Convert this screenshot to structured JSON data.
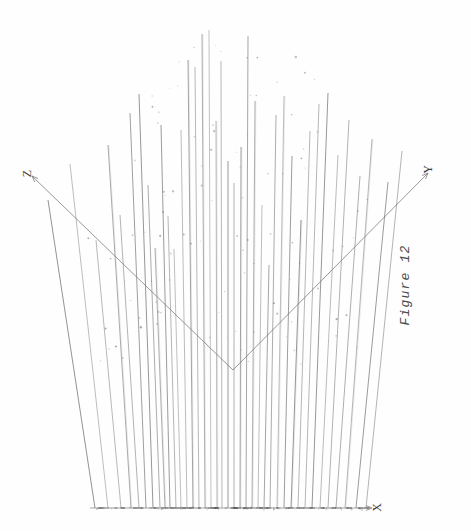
{
  "figure": {
    "caption": "Figure 12",
    "axes": {
      "x_label": "X",
      "y_label": "Y",
      "z_label": "Z"
    },
    "background_color": "#fefefe",
    "ink_color": "#6b6b6b",
    "axis_color": "#777777"
  },
  "chart_data": {
    "type": "scatter",
    "title": "Figure 12",
    "subtitle": "",
    "xlabel": "X",
    "ylabel": "Y",
    "zlabel": "Z",
    "projection": "3d-perspective-stem",
    "grid": false,
    "legend": null,
    "annotations": [],
    "origin_vertex": [
      233,
      370
    ],
    "axis_endpoints": {
      "z_axis": [
        [
          32,
          176
        ],
        [
          233,
          370
        ]
      ],
      "y_axis": [
        [
          233,
          370
        ],
        [
          428,
          173
        ]
      ],
      "x_axis": [
        [
          90,
          508
        ],
        [
          370,
          508
        ]
      ]
    },
    "baseline_y": 508,
    "stems": [
      {
        "x_base": 95,
        "x_top": 48,
        "y_top": 200,
        "height": 308
      },
      {
        "x_base": 108,
        "x_top": 70,
        "y_top": 164,
        "height": 344
      },
      {
        "x_base": 121,
        "x_top": 96,
        "y_top": 240,
        "height": 268
      },
      {
        "x_base": 131,
        "x_top": 108,
        "y_top": 145,
        "height": 363
      },
      {
        "x_base": 139,
        "x_top": 120,
        "y_top": 215,
        "height": 293
      },
      {
        "x_base": 146,
        "x_top": 130,
        "y_top": 113,
        "height": 395
      },
      {
        "x_base": 153,
        "x_top": 139,
        "y_top": 94,
        "height": 414
      },
      {
        "x_base": 160,
        "x_top": 148,
        "y_top": 185,
        "height": 323
      },
      {
        "x_base": 165,
        "x_top": 155,
        "y_top": 248,
        "height": 260
      },
      {
        "x_base": 170,
        "x_top": 161,
        "y_top": 125,
        "height": 383
      },
      {
        "x_base": 176,
        "x_top": 168,
        "y_top": 216,
        "height": 292
      },
      {
        "x_base": 181,
        "x_top": 174,
        "y_top": 249,
        "height": 259
      },
      {
        "x_base": 187,
        "x_top": 181,
        "y_top": 130,
        "height": 378
      },
      {
        "x_base": 193,
        "x_top": 188,
        "y_top": 60,
        "height": 448
      },
      {
        "x_base": 199,
        "x_top": 195,
        "y_top": 67,
        "height": 441
      },
      {
        "x_base": 205,
        "x_top": 202,
        "y_top": 34,
        "height": 474
      },
      {
        "x_base": 211,
        "x_top": 209,
        "y_top": 30,
        "height": 478
      },
      {
        "x_base": 217,
        "x_top": 216,
        "y_top": 121,
        "height": 387
      },
      {
        "x_base": 222,
        "x_top": 221,
        "y_top": 61,
        "height": 447
      },
      {
        "x_base": 228,
        "x_top": 228,
        "y_top": 161,
        "height": 347
      },
      {
        "x_base": 234,
        "x_top": 234,
        "y_top": 183,
        "height": 325
      },
      {
        "x_base": 240,
        "x_top": 241,
        "y_top": 147,
        "height": 361
      },
      {
        "x_base": 246,
        "x_top": 248,
        "y_top": 36,
        "height": 472
      },
      {
        "x_base": 252,
        "x_top": 255,
        "y_top": 101,
        "height": 407
      },
      {
        "x_base": 258,
        "x_top": 262,
        "y_top": 205,
        "height": 303
      },
      {
        "x_base": 264,
        "x_top": 269,
        "y_top": 265,
        "height": 243
      },
      {
        "x_base": 270,
        "x_top": 276,
        "y_top": 115,
        "height": 393
      },
      {
        "x_base": 277,
        "x_top": 284,
        "y_top": 96,
        "height": 412
      },
      {
        "x_base": 284,
        "x_top": 292,
        "y_top": 156,
        "height": 352
      },
      {
        "x_base": 291,
        "x_top": 301,
        "y_top": 220,
        "height": 288
      },
      {
        "x_base": 298,
        "x_top": 310,
        "y_top": 131,
        "height": 377
      },
      {
        "x_base": 305,
        "x_top": 319,
        "y_top": 104,
        "height": 404
      },
      {
        "x_base": 312,
        "x_top": 328,
        "y_top": 93,
        "height": 415
      },
      {
        "x_base": 320,
        "x_top": 338,
        "y_top": 155,
        "height": 353
      },
      {
        "x_base": 328,
        "x_top": 349,
        "y_top": 120,
        "height": 388
      },
      {
        "x_base": 336,
        "x_top": 360,
        "y_top": 176,
        "height": 332
      },
      {
        "x_base": 345,
        "x_top": 372,
        "y_top": 139,
        "height": 369
      },
      {
        "x_base": 356,
        "x_top": 388,
        "y_top": 182,
        "height": 326
      },
      {
        "x_base": 366,
        "x_top": 402,
        "y_top": 151,
        "height": 357
      }
    ],
    "speckle_count": 120,
    "axis_ranges": {
      "x": [
        0,
        1
      ],
      "y": [
        0,
        1
      ],
      "z": [
        0,
        1
      ]
    }
  }
}
